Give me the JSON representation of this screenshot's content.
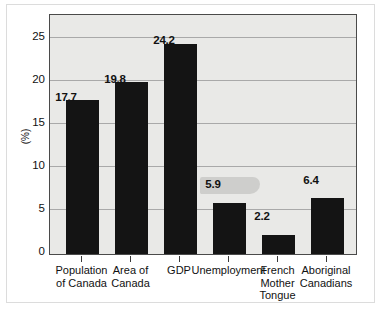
{
  "figure": {
    "caption": ""
  },
  "axis": {
    "y_label": "(%)",
    "y_ticks": [
      "0",
      "5",
      "10",
      "15",
      "20",
      "25"
    ]
  },
  "chart_data": {
    "type": "bar",
    "title": "",
    "xlabel": "",
    "ylabel": "(%)",
    "ylim": [
      0,
      27.5
    ],
    "grid": true,
    "legend": "none",
    "bar_color": "#141414",
    "plot_background": "#e9e9e7",
    "categories": [
      "Population of Canada",
      "Area of Canada",
      "GDP",
      "Unemployment",
      "French Mother Tongue",
      "Aboriginal Canadians"
    ],
    "category_lines": [
      [
        "Population",
        "of Canada"
      ],
      [
        "Area of",
        "Canada"
      ],
      [
        "GDP"
      ],
      [
        "Unemployment"
      ],
      [
        "French",
        "Mother",
        "Tongue"
      ],
      [
        "Aboriginal",
        "Canadians"
      ]
    ],
    "values": [
      17.7,
      19.8,
      24.2,
      5.9,
      2.2,
      6.4
    ],
    "value_labels": [
      "17.7",
      "19.8",
      "24.2",
      "5.9",
      "2.2",
      "6.4"
    ],
    "yticks": [
      0,
      5,
      10,
      15,
      20,
      25
    ]
  }
}
